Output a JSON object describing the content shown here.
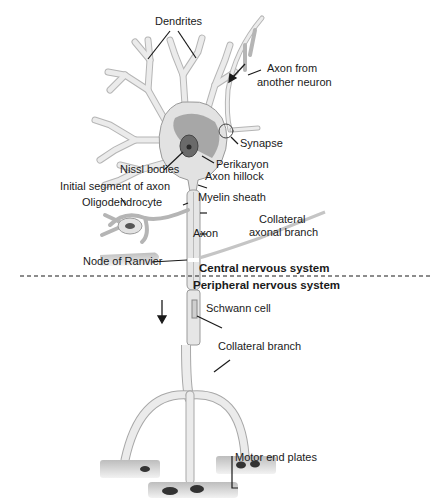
{
  "diagram": {
    "type": "neuron-anatomy",
    "divider": {
      "upper_region": "Central nervous system",
      "lower_region": "Peripheral nervous system"
    },
    "labels": {
      "dendrites": "Dendrites",
      "axon_from_another_neuron_1": "Axon from",
      "axon_from_another_neuron_2": "another neuron",
      "synapse": "Synapse",
      "perikaryon": "Perikaryon",
      "nissl_bodies": "Nissl bodies",
      "axon_hillock": "Axon hillock",
      "initial_segment": "Initial segment of axon",
      "myelin_sheath": "Myelin sheath",
      "oligodendrocyte": "Oligodendrocyte",
      "collateral_axonal_branch_1": "Collateral",
      "collateral_axonal_branch_2": "axonal branch",
      "axon": "Axon",
      "node_of_ranvier": "Node of Ranvier",
      "schwann_cell": "Schwann cell",
      "collateral_branch": "Collateral branch",
      "motor_end_plates": "Motor end plates"
    },
    "colors": {
      "line": "#1a1a1a",
      "cell_fill": "#e4e4e4",
      "cell_stroke": "#9a9a9a",
      "nissl": "#8a8a8a",
      "nucleus": "#5a5a5a",
      "muscle": "#cfcfcf"
    }
  }
}
